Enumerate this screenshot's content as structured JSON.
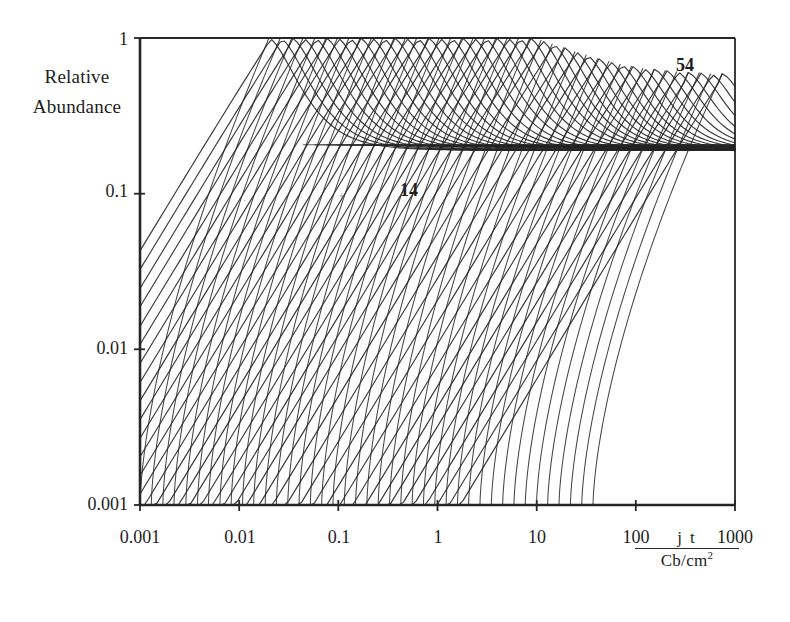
{
  "figure": {
    "kind": "scanned-scientific-plot",
    "background": "#ffffff",
    "ink_color": "#262626"
  },
  "axes": {
    "y_label_line1": "Relative",
    "y_label_line2": "Abundance",
    "y_ticks": [
      "1",
      "0.1",
      "0.01",
      "0.001"
    ],
    "x_ticks": [
      "0.001",
      "0.01",
      "0.1",
      "1",
      "10",
      "100",
      "1000"
    ],
    "x_title_numerator": "j t",
    "x_title_denominator": "Cb/cm",
    "x_title_denominator_exponent": "2"
  },
  "annotations": [
    {
      "text": "14",
      "x": 400,
      "y": 181
    },
    {
      "text": "54",
      "x": 676,
      "y": 56
    }
  ],
  "chart_data": {
    "type": "line",
    "title": "",
    "xlabel": "j t / Cb/cm^2",
    "ylabel": "Relative Abundance",
    "xscale": "log",
    "yscale": "log",
    "xlim": [
      0.001,
      1000
    ],
    "ylim": [
      0.001,
      1
    ],
    "grid": false,
    "legend": "none",
    "x_tick_values": [
      0.001,
      0.01,
      0.1,
      1,
      10,
      100,
      1000
    ],
    "y_tick_values": [
      0.001,
      0.01,
      0.1,
      1
    ],
    "series_label_first": "14",
    "series_label_last": "54",
    "series_count": 41,
    "series_index_first": 14,
    "series_index_last": 54,
    "series": [
      {
        "name": "14",
        "rise_start_x": 0.001,
        "peak_x": 0.02,
        "peak_y": 1.0,
        "plateau_y": 0.19
      },
      {
        "name": "15",
        "rise_start_x": 0.0013,
        "peak_x": 0.026,
        "peak_y": 1.0,
        "plateau_y": 0.19
      },
      {
        "name": "16",
        "rise_start_x": 0.0017,
        "peak_x": 0.034,
        "peak_y": 1.0,
        "plateau_y": 0.19
      },
      {
        "name": "17",
        "rise_start_x": 0.0022,
        "peak_x": 0.044,
        "peak_y": 1.0,
        "plateau_y": 0.19
      },
      {
        "name": "18",
        "rise_start_x": 0.0029,
        "peak_x": 0.058,
        "peak_y": 1.0,
        "plateau_y": 0.19
      },
      {
        "name": "19",
        "rise_start_x": 0.0038,
        "peak_x": 0.075,
        "peak_y": 1.0,
        "plateau_y": 0.19
      },
      {
        "name": "20",
        "rise_start_x": 0.0049,
        "peak_x": 0.098,
        "peak_y": 1.0,
        "plateau_y": 0.19
      },
      {
        "name": "21",
        "rise_start_x": 0.0064,
        "peak_x": 0.128,
        "peak_y": 1.0,
        "plateau_y": 0.19
      },
      {
        "name": "22",
        "rise_start_x": 0.0083,
        "peak_x": 0.166,
        "peak_y": 1.0,
        "plateau_y": 0.19
      },
      {
        "name": "23",
        "rise_start_x": 0.0108,
        "peak_x": 0.216,
        "peak_y": 1.0,
        "plateau_y": 0.19
      },
      {
        "name": "24",
        "rise_start_x": 0.014,
        "peak_x": 0.281,
        "peak_y": 1.0,
        "plateau_y": 0.19
      },
      {
        "name": "25",
        "rise_start_x": 0.0183,
        "peak_x": 0.365,
        "peak_y": 1.0,
        "plateau_y": 0.19
      },
      {
        "name": "26",
        "rise_start_x": 0.0237,
        "peak_x": 0.475,
        "peak_y": 1.0,
        "plateau_y": 0.19
      },
      {
        "name": "27",
        "rise_start_x": 0.0309,
        "peak_x": 0.617,
        "peak_y": 1.0,
        "plateau_y": 0.19
      },
      {
        "name": "28",
        "rise_start_x": 0.0401,
        "peak_x": 0.803,
        "peak_y": 1.0,
        "plateau_y": 0.19
      },
      {
        "name": "29",
        "rise_start_x": 0.0522,
        "peak_x": 1.04,
        "peak_y": 1.0,
        "plateau_y": 0.19
      },
      {
        "name": "30",
        "rise_start_x": 0.0679,
        "peak_x": 1.36,
        "peak_y": 1.0,
        "plateau_y": 0.19
      },
      {
        "name": "31",
        "rise_start_x": 0.0882,
        "peak_x": 1.76,
        "peak_y": 1.0,
        "plateau_y": 0.19
      },
      {
        "name": "32",
        "rise_start_x": 0.1147,
        "peak_x": 2.29,
        "peak_y": 1.0,
        "plateau_y": 0.19
      },
      {
        "name": "33",
        "rise_start_x": 0.1492,
        "peak_x": 2.98,
        "peak_y": 1.0,
        "plateau_y": 0.19
      },
      {
        "name": "34",
        "rise_start_x": 0.194,
        "peak_x": 3.88,
        "peak_y": 1.0,
        "plateau_y": 0.19
      },
      {
        "name": "35",
        "rise_start_x": 0.2523,
        "peak_x": 5.05,
        "peak_y": 1.0,
        "plateau_y": 0.19
      },
      {
        "name": "36",
        "rise_start_x": 0.3281,
        "peak_x": 6.56,
        "peak_y": 1.0,
        "plateau_y": 0.19
      },
      {
        "name": "37",
        "rise_start_x": 0.4266,
        "peak_x": 8.53,
        "peak_y": 1.0,
        "plateau_y": 0.19
      },
      {
        "name": "38",
        "rise_start_x": 0.5548,
        "peak_x": 11.1,
        "peak_y": 0.97,
        "plateau_y": 0.19
      },
      {
        "name": "39",
        "rise_start_x": 0.7214,
        "peak_x": 14.4,
        "peak_y": 0.92,
        "plateau_y": 0.19
      },
      {
        "name": "40",
        "rise_start_x": 0.9381,
        "peak_x": 18.8,
        "peak_y": 0.87,
        "plateau_y": 0.19
      },
      {
        "name": "41",
        "rise_start_x": 1.22,
        "peak_x": 24.4,
        "peak_y": 0.82,
        "plateau_y": 0.19
      },
      {
        "name": "42",
        "rise_start_x": 1.59,
        "peak_x": 31.7,
        "peak_y": 0.78,
        "plateau_y": 0.19
      },
      {
        "name": "43",
        "rise_start_x": 2.06,
        "peak_x": 41.3,
        "peak_y": 0.74,
        "plateau_y": 0.19
      },
      {
        "name": "44",
        "rise_start_x": 2.68,
        "peak_x": 53.7,
        "peak_y": 0.71,
        "plateau_y": 0.19
      },
      {
        "name": "45",
        "rise_start_x": 3.49,
        "peak_x": 69.8,
        "peak_y": 0.68,
        "plateau_y": 0.19
      },
      {
        "name": "46",
        "rise_start_x": 4.54,
        "peak_x": 90.7,
        "peak_y": 0.66,
        "plateau_y": 0.19
      },
      {
        "name": "47",
        "rise_start_x": 5.9,
        "peak_x": 118.0,
        "peak_y": 0.64,
        "plateau_y": 0.19
      },
      {
        "name": "48",
        "rise_start_x": 7.67,
        "peak_x": 153.0,
        "peak_y": 0.63,
        "plateau_y": 0.19
      },
      {
        "name": "49",
        "rise_start_x": 9.97,
        "peak_x": 199.0,
        "peak_y": 0.62,
        "plateau_y": 0.19
      },
      {
        "name": "50",
        "rise_start_x": 12.9,
        "peak_x": 259.0,
        "peak_y": 0.61,
        "plateau_y": 0.19
      },
      {
        "name": "51",
        "rise_start_x": 16.8,
        "peak_x": 337.0,
        "peak_y": 0.6,
        "plateau_y": 0.19
      },
      {
        "name": "52",
        "rise_start_x": 21.9,
        "peak_x": 438.0,
        "peak_y": 0.6,
        "plateau_y": 0.19
      },
      {
        "name": "53",
        "rise_start_x": 28.5,
        "peak_x": 569.0,
        "peak_y": 0.59,
        "plateau_y": 0.19
      },
      {
        "name": "54",
        "rise_start_x": 37.0,
        "peak_x": 740.0,
        "peak_y": 0.59,
        "plateau_y": 0.19
      }
    ]
  },
  "plot_geometry": {
    "left_px": 140,
    "right_px": 735,
    "top_px": 38,
    "bottom_px": 505
  }
}
